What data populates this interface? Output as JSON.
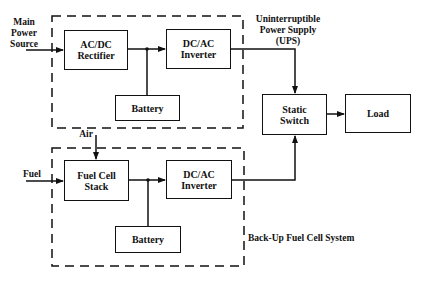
{
  "diagram": {
    "type": "block-diagram",
    "ups_group": {
      "label": "Uninterruptible\nPower Supply\n(UPS)",
      "blocks": {
        "rectifier": "AC/DC\nRectifier",
        "inverter": "DC/AC\nInverter",
        "battery": "Battery"
      }
    },
    "fuel_cell_group": {
      "label": "Back-Up Fuel Cell System",
      "blocks": {
        "stack": "Fuel Cell\nStack",
        "inverter": "DC/AC\nInverter",
        "battery": "Battery"
      }
    },
    "static_switch": "Static\nSwitch",
    "load": "Load",
    "inputs": {
      "main_power": "Main\nPower\nSource",
      "fuel": "Fuel",
      "air": "Air"
    },
    "edges": [
      {
        "from": "Main Power Source",
        "to": "AC/DC Rectifier"
      },
      {
        "from": "AC/DC Rectifier",
        "to": "DC/AC Inverter (UPS)"
      },
      {
        "from": "Battery (UPS)",
        "to": "DC bus (UPS)"
      },
      {
        "from": "DC/AC Inverter (UPS)",
        "to": "Static Switch"
      },
      {
        "from": "Fuel",
        "to": "Fuel Cell Stack"
      },
      {
        "from": "Air",
        "to": "Fuel Cell Stack"
      },
      {
        "from": "Fuel Cell Stack",
        "to": "DC/AC Inverter (Fuel Cell)"
      },
      {
        "from": "Battery (Fuel Cell)",
        "to": "DC bus (Fuel Cell)"
      },
      {
        "from": "DC/AC Inverter (Fuel Cell)",
        "to": "Static Switch"
      },
      {
        "from": "Static Switch",
        "to": "Load"
      }
    ]
  }
}
